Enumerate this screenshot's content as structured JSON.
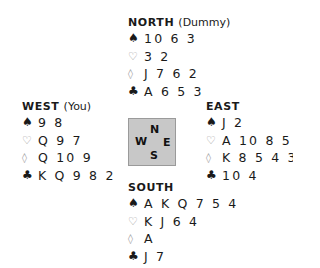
{
  "hands": {
    "north": {
      "direction": "NORTH",
      "role": "(Dummy)",
      "spades": "10 6 3",
      "hearts": "3 2",
      "diamonds": "J 7 6 2",
      "clubs": "A 6 5 3"
    },
    "west": {
      "direction": "WEST",
      "role": "(You)",
      "spades": "9 8",
      "hearts": "Q 9 7",
      "diamonds": "Q 10 9",
      "clubs": "K Q 9 8 2"
    },
    "east": {
      "direction": "EAST",
      "role": "",
      "spades": "J 2",
      "hearts": "A 10 8 5",
      "diamonds": "K 8 5 4 3",
      "clubs": "10 4"
    },
    "south": {
      "direction": "SOUTH",
      "role": "",
      "spades": "A K Q 7 5 4",
      "hearts": "K J 6 4",
      "diamonds": "A",
      "clubs": "J 7"
    }
  },
  "compass": {
    "n": "N",
    "w": "W",
    "e": "E",
    "s": "S"
  },
  "suit_symbols": {
    "spades": "♠",
    "hearts": "♡",
    "diamonds": "◊",
    "clubs": "♣"
  },
  "colors": {
    "text": "#1a1a1a",
    "outline_suit": "#9a9a9a",
    "compass_bg": "#c8c8c8",
    "compass_border": "#9a9a9a"
  }
}
